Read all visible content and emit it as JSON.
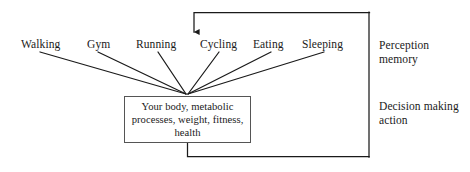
{
  "diagram": {
    "activities": [
      {
        "label": "Walking",
        "x": 21,
        "y": 38
      },
      {
        "label": "Gym",
        "x": 87,
        "y": 38
      },
      {
        "label": "Running",
        "x": 136,
        "y": 38
      },
      {
        "label": "Cycling",
        "x": 200,
        "y": 38
      },
      {
        "label": "Eating",
        "x": 253,
        "y": 38
      },
      {
        "label": "Sleeping",
        "x": 302,
        "y": 38
      }
    ],
    "center_box": {
      "lines": [
        "Your body, metabolic",
        "processes, weight, fitness,",
        "health"
      ]
    },
    "side_labels": [
      {
        "name": "perception-memory",
        "lines": [
          "Perception",
          "memory"
        ],
        "x": 379,
        "y": 38
      },
      {
        "name": "decision-making-action",
        "lines": [
          "Decision making",
          "action"
        ],
        "x": 379,
        "y": 99
      }
    ],
    "colors": {
      "stroke": "#1a1a1a",
      "box_border": "#555555",
      "text": "#1a1a1a",
      "background": "#ffffff"
    }
  }
}
